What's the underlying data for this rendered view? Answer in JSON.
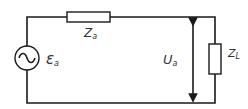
{
  "diagram": {
    "type": "electrical circuit",
    "components": {
      "source": {
        "symbol": "ε",
        "subscript": "a",
        "kind": "ac-voltage-source"
      },
      "series_impedance": {
        "symbol": "Z",
        "subscript": "a"
      },
      "load_impedance": {
        "symbol": "Z",
        "subscript": "L"
      },
      "output_voltage": {
        "symbol": "U",
        "subscript": "a"
      }
    },
    "colors": {
      "line": "#1a1a1a",
      "text": "#333333",
      "background": "#ffffff"
    }
  }
}
